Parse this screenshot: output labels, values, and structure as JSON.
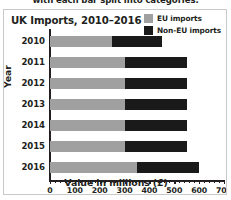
{
  "caption": {
    "text": "with each bar split into categories."
  },
  "chart_card": {
    "title": "UK Imports, 2010–2016"
  },
  "legend": {
    "position": "top-right",
    "items": [
      {
        "label": "EU imports",
        "color": "#a0a0a0",
        "swatch_name": "legend-swatch-eu"
      },
      {
        "label": "Non-EU imports",
        "color": "#1a1a1a",
        "swatch_name": "legend-swatch-non-eu"
      }
    ]
  },
  "chart_data": {
    "type": "bar",
    "orientation": "horizontal",
    "stacked": true,
    "title": "UK Imports, 2010–2016",
    "xlabel": "Value in millions (£)",
    "ylabel": "Year",
    "categories": [
      "2010",
      "2011",
      "2012",
      "2013",
      "2014",
      "2015",
      "2016"
    ],
    "series": [
      {
        "name": "EU imports",
        "color": "#a0a0a0",
        "values": [
          250,
          300,
          300,
          300,
          300,
          300,
          350
        ]
      },
      {
        "name": "Non-EU imports",
        "color": "#1a1a1a",
        "values": [
          200,
          250,
          250,
          250,
          250,
          250,
          250
        ]
      }
    ],
    "totals": [
      450,
      550,
      550,
      550,
      550,
      550,
      600
    ],
    "xlim": [
      0,
      700
    ],
    "xticks": [
      0,
      100,
      200,
      300,
      400,
      500,
      600,
      700
    ],
    "xtick_labels": [
      "0",
      "100",
      "200",
      "300",
      "400",
      "500",
      "600",
      "700"
    ],
    "xtick_minor_step": 20,
    "grid": false,
    "legend_position": "top-right"
  }
}
